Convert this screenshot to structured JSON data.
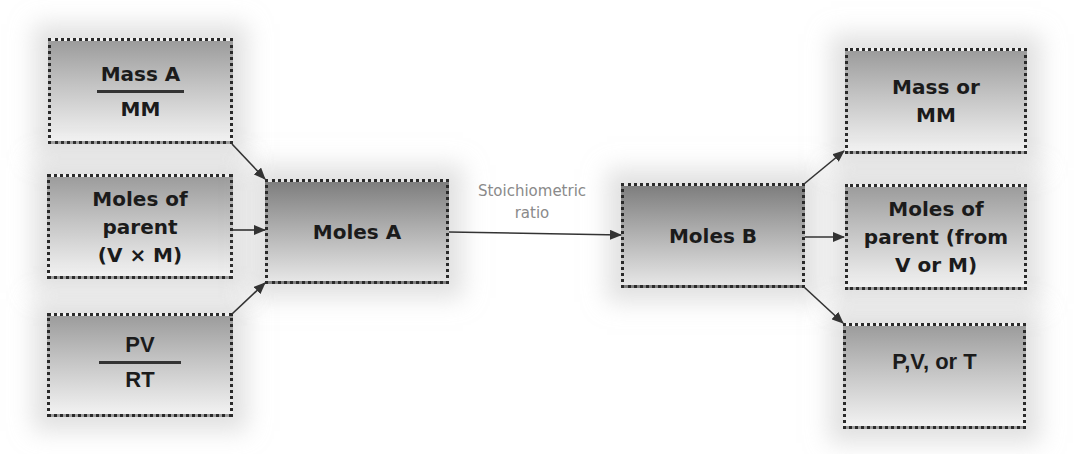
{
  "diagram": {
    "inputs": [
      {
        "id": "mass-a-over-mm",
        "numerator": "Mass A",
        "denominator": "MM"
      },
      {
        "id": "moles-of-parent-vm",
        "lines": [
          "Moles of",
          "parent",
          "(V × M)"
        ]
      },
      {
        "id": "pv-over-rt",
        "numerator": "PV",
        "denominator": "RT"
      }
    ],
    "moles_a": "Moles A",
    "connector_label": [
      "Stoichiometric",
      "ratio"
    ],
    "moles_b": "Moles B",
    "outputs": [
      {
        "id": "mass-or-mm",
        "lines": [
          "Mass or",
          "MM"
        ]
      },
      {
        "id": "moles-of-parent-from",
        "lines": [
          "Moles of",
          "parent (from",
          "V or M)"
        ]
      },
      {
        "id": "p-v-or-t",
        "lines": [
          "P,V, or T"
        ]
      }
    ],
    "edges": [
      {
        "from": "Mass A / MM",
        "to": "Moles A"
      },
      {
        "from": "Moles of parent (V × M)",
        "to": "Moles A"
      },
      {
        "from": "PV / RT",
        "to": "Moles A"
      },
      {
        "from": "Moles A",
        "to": "Moles B",
        "label": "Stoichiometric ratio"
      },
      {
        "from": "Moles B",
        "to": "Mass or MM"
      },
      {
        "from": "Moles B",
        "to": "Moles of parent (from V or M)"
      },
      {
        "from": "Moles B",
        "to": "P,V, or T"
      }
    ],
    "colors": {
      "border": "#2a2a2a",
      "text": "#1b1b1b",
      "label": "#8a8a8a",
      "arrow": "#333333"
    }
  }
}
